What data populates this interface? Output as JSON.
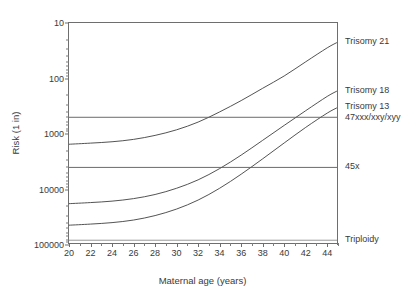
{
  "chart_data": {
    "type": "line",
    "title": "",
    "xlabel": "Maternal age (years)",
    "ylabel": "Risk (1 in)",
    "xlim": [
      20,
      45
    ],
    "ylim": [
      10,
      100000
    ],
    "yscale": "log",
    "y_inverted": true,
    "grid": false,
    "legend_position": "right-outside",
    "x_tick_labels": [
      "20",
      "22",
      "24",
      "26",
      "28",
      "30",
      "32",
      "34",
      "36",
      "38",
      "40",
      "42",
      "44"
    ],
    "x_tick_values": [
      20,
      22,
      24,
      26,
      28,
      30,
      32,
      34,
      36,
      38,
      40,
      42,
      44
    ],
    "x_minor_tick_values": [
      21,
      23,
      25,
      27,
      29,
      31,
      33,
      35,
      37,
      39,
      41,
      43,
      45
    ],
    "y_tick_labels": [
      "10",
      "100",
      "1000",
      "10000",
      "100000"
    ],
    "y_tick_values": [
      10,
      100,
      1000,
      10000,
      100000
    ],
    "series": [
      {
        "name": "Trisomy 21",
        "label": "Trisomy 21",
        "kind": "curve",
        "color": "#3f3f3f",
        "x": [
          20,
          22,
          24,
          26,
          28,
          30,
          32,
          34,
          36,
          38,
          40,
          42,
          44,
          45
        ],
        "values": [
          1530,
          1460,
          1380,
          1250,
          1060,
          840,
          610,
          400,
          250,
          150,
          90,
          50,
          28,
          22
        ]
      },
      {
        "name": "Trisomy 18",
        "label": "Trisomy 18",
        "kind": "curve",
        "color": "#3f3f3f",
        "x": [
          20,
          22,
          24,
          26,
          28,
          30,
          32,
          34,
          36,
          38,
          40,
          42,
          44,
          45
        ],
        "values": [
          18000,
          17200,
          16200,
          14600,
          12300,
          9500,
          6700,
          4200,
          2400,
          1300,
          700,
          380,
          210,
          165
        ]
      },
      {
        "name": "Trisomy 13",
        "label": "Trisomy 13",
        "kind": "curve",
        "color": "#3f3f3f",
        "x": [
          20,
          22,
          24,
          26,
          28,
          30,
          32,
          34,
          36,
          38,
          40,
          42,
          44,
          45
        ],
        "values": [
          44000,
          42000,
          39500,
          35500,
          29500,
          22500,
          15500,
          9500,
          5300,
          2800,
          1450,
          760,
          420,
          330
        ]
      },
      {
        "name": "47xxx/xxy/xyy",
        "label": "47xxx/xxy/xyy",
        "kind": "constant",
        "color": "#5a5a5a",
        "value": 500
      },
      {
        "name": "45x",
        "label": "45x",
        "kind": "constant",
        "color": "#5a5a5a",
        "value": 4000
      },
      {
        "name": "Triploidy",
        "label": "Triploidy",
        "kind": "constant",
        "color": "#8c8c8c",
        "value": 82000
      }
    ],
    "annotations": []
  },
  "axis": {
    "x_title": "Maternal age (years)",
    "y_title": "Risk (1 in)"
  },
  "series_labels": [
    {
      "text": "Trisomy 21",
      "name": "series-label-trisomy-21"
    },
    {
      "text": "Trisomy 18",
      "name": "series-label-trisomy-18"
    },
    {
      "text": "47xxx/xxy/xyy",
      "name": "series-label-47xxx"
    },
    {
      "text": "Trisomy 13",
      "name": "series-label-trisomy-13"
    },
    {
      "text": "45x",
      "name": "series-label-45x"
    },
    {
      "text": "Triploidy",
      "name": "series-label-triploidy"
    }
  ],
  "colors": {
    "axis": "#6e6e6e",
    "curve": "#3f3f3f",
    "flat_line": "#5a5a5a",
    "background": "#ffffff",
    "text": "#3a3a3a"
  }
}
